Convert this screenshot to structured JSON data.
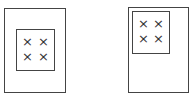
{
  "diagram": {
    "panels": [
      {
        "name": "left-panel",
        "inner_position": "center",
        "marks": [
          "×",
          "×",
          "×",
          "×"
        ]
      },
      {
        "name": "right-panel",
        "inner_position": "top-left",
        "marks": [
          "×",
          "×",
          "×",
          "×"
        ]
      }
    ],
    "stroke_color": "#444444"
  }
}
